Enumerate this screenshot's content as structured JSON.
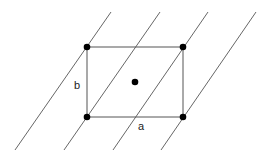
{
  "diagram": {
    "type": "lattice-unit-cell",
    "width": 266,
    "height": 159,
    "colors": {
      "background": "#ffffff",
      "line": "#555555",
      "point": "#000000",
      "label": "#222222"
    },
    "rectangle": {
      "x1": 87,
      "y1": 47,
      "x2": 183,
      "y2": 117
    },
    "lattice_points": [
      {
        "name": "top-left",
        "x": 87,
        "y": 47
      },
      {
        "name": "top-right",
        "x": 183,
        "y": 47
      },
      {
        "name": "bottom-left",
        "x": 87,
        "y": 117
      },
      {
        "name": "bottom-right",
        "x": 183,
        "y": 117
      },
      {
        "name": "center",
        "x": 135,
        "y": 82
      }
    ],
    "parallel_lines": [
      {
        "x1": 111,
        "y1": 12,
        "x2": 15,
        "y2": 150
      },
      {
        "x1": 160,
        "y1": 12,
        "x2": 64,
        "y2": 150
      },
      {
        "x1": 208,
        "y1": 12,
        "x2": 113,
        "y2": 150
      },
      {
        "x1": 256,
        "y1": 12,
        "x2": 161,
        "y2": 150
      }
    ],
    "labels": [
      {
        "name": "label-b",
        "text": "b",
        "x": 74,
        "y": 89
      },
      {
        "name": "label-a",
        "text": "a",
        "x": 138,
        "y": 130
      }
    ]
  }
}
